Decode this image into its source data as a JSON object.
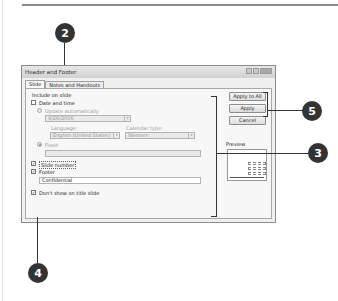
{
  "dialog": {
    "title": "Header and Footer",
    "tabs": [
      {
        "label": "Slide",
        "active": true
      },
      {
        "label": "Notes and Handouts",
        "active": false
      }
    ],
    "group_label": "Include on slide",
    "date_time": {
      "label": "Date and time",
      "checked": false
    },
    "update_auto": {
      "label": "Update automatically",
      "selected": false
    },
    "date_value": "9/26/2006",
    "language": {
      "label": "Language:",
      "value": "English (United States)"
    },
    "calendar": {
      "label": "Calendar type:",
      "value": "Western"
    },
    "fixed": {
      "label": "Fixed",
      "selected": true,
      "value": ""
    },
    "slide_number": {
      "label": "Slide number",
      "checked": true
    },
    "footer": {
      "label": "Footer",
      "checked": true,
      "value": "Confidential"
    },
    "dont_show": {
      "label": "Don't show on title slide",
      "checked": true
    },
    "buttons": {
      "apply_all": "Apply to All",
      "apply": "Apply",
      "cancel": "Cancel"
    },
    "preview_label": "Preview"
  },
  "callouts": [
    "2",
    "5",
    "3",
    "4"
  ],
  "icons": {
    "check": "✓",
    "dropdown": "▾"
  },
  "colors": {
    "callout": "#333333",
    "dialog_bg": "#f0f0f0"
  }
}
